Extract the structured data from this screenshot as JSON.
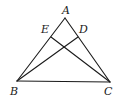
{
  "diagram": {
    "type": "geometry",
    "points": {
      "A": {
        "label": "A",
        "x": 65,
        "y": 18,
        "lx": 62,
        "ly": 14
      },
      "B": {
        "label": "B",
        "x": 17,
        "y": 81,
        "lx": 10,
        "ly": 95
      },
      "C": {
        "label": "C",
        "x": 110,
        "y": 82,
        "lx": 104,
        "ly": 95
      },
      "E": {
        "label": "E",
        "x": 51,
        "y": 37,
        "lx": 41,
        "ly": 33
      },
      "D": {
        "label": "D",
        "x": 78,
        "y": 37,
        "lx": 79,
        "ly": 33
      }
    },
    "segments": [
      {
        "name": "segment-AB",
        "from": "A",
        "to": "B"
      },
      {
        "name": "segment-AC",
        "from": "A",
        "to": "C"
      },
      {
        "name": "segment-BC",
        "from": "B",
        "to": "C"
      },
      {
        "name": "segment-BD",
        "from": "B",
        "to": "D"
      },
      {
        "name": "segment-CE",
        "from": "C",
        "to": "E"
      }
    ]
  }
}
